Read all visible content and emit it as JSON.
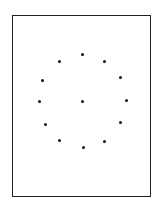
{
  "figure": {
    "type": "dot-pattern",
    "frame": {
      "x": 12,
      "y": 15,
      "width": 139,
      "height": 182,
      "stroke": "#222222"
    },
    "dot_color": "#111111",
    "dots": [
      {
        "id": "top",
        "x": 82,
        "y": 54
      },
      {
        "id": "upper-left",
        "x": 59,
        "y": 61
      },
      {
        "id": "upper-right",
        "x": 104,
        "y": 61
      },
      {
        "id": "left-upper",
        "x": 42,
        "y": 80
      },
      {
        "id": "right-upper",
        "x": 120,
        "y": 77
      },
      {
        "id": "left",
        "x": 39,
        "y": 101
      },
      {
        "id": "center",
        "x": 82,
        "y": 101
      },
      {
        "id": "right",
        "x": 126,
        "y": 100
      },
      {
        "id": "left-lower",
        "x": 45,
        "y": 124
      },
      {
        "id": "right-lower",
        "x": 120,
        "y": 122
      },
      {
        "id": "lower-left",
        "x": 59,
        "y": 140
      },
      {
        "id": "lower-right",
        "x": 104,
        "y": 141
      },
      {
        "id": "bottom",
        "x": 83,
        "y": 147
      }
    ]
  }
}
